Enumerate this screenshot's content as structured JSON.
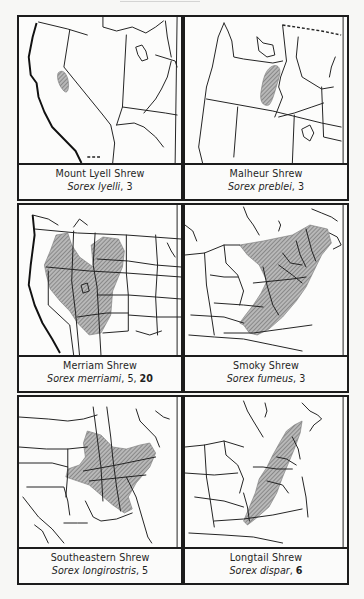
{
  "panels": [
    {
      "common_name": "Mount Lyell Shrew",
      "scientific_name": "Sorex lyelli",
      "plate_refs": ", 3",
      "plate_refs_bold": "",
      "region": "California / Nevada (Sierra Nevada)"
    },
    {
      "common_name": "Malheur Shrew",
      "scientific_name": "Sorex preblei",
      "plate_refs": ", 3",
      "plate_refs_bold": "",
      "region": "Oregon / Idaho"
    },
    {
      "common_name": "Merriam Shrew",
      "scientific_name": "Sorex merriami",
      "plate_refs": ", 5, ",
      "plate_refs_bold": "20",
      "region": "Western United States"
    },
    {
      "common_name": "Smoky Shrew",
      "scientific_name": "Sorex fumeus",
      "plate_refs": ", 3",
      "plate_refs_bold": "",
      "region": "Northeastern United States / Appalachians"
    },
    {
      "common_name": "Southeastern Shrew",
      "scientific_name": "Sorex longirostris",
      "plate_refs": ", 5",
      "plate_refs_bold": "",
      "region": "Southeastern United States"
    },
    {
      "common_name": "Longtail Shrew",
      "scientific_name": "Sorex dispar",
      "plate_refs": ", ",
      "plate_refs_bold": "6",
      "region": "Appalachian Mountains / New England"
    }
  ],
  "colors": {
    "ink": "#1c1c1c",
    "paper": "#f7f7f5",
    "range_fill": "#9a9a9a"
  }
}
